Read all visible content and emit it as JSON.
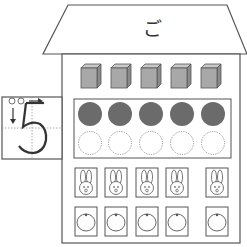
{
  "roof": {
    "label": "ご"
  },
  "number_box": {
    "digit": "5",
    "stroke_order": [
      "①",
      "②"
    ]
  },
  "rows": {
    "cubes": {
      "count": 5,
      "icon": "cube-icon"
    },
    "dots": {
      "filled": 5,
      "empty": 5,
      "filled_color": "#6b6b6b"
    },
    "rabbits": {
      "count": 5,
      "icon": "rabbit-icon"
    },
    "oranges": {
      "count": 5,
      "icon": "orange-icon"
    }
  },
  "colors": {
    "line": "#555555",
    "cube_face": "#a8a8a8",
    "cube_top": "#c8c8c8",
    "cube_side": "#8a8a8a",
    "dot_fill": "#6b6b6b"
  }
}
